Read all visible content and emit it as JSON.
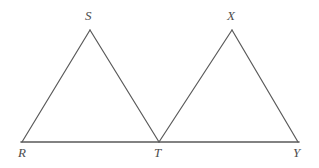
{
  "figure": {
    "type": "geometry-diagram",
    "background_color": "#ffffff",
    "stroke_color": "#5a5a5a",
    "label_color": "#4d4d4d",
    "stroke_width": 1.2,
    "baseline_stroke_width": 1.6,
    "canvas": {
      "width": 319,
      "height": 168
    },
    "points": {
      "R": {
        "label": "R",
        "x": 22,
        "y": 142,
        "label_x": 18,
        "label_y": 146
      },
      "S": {
        "label": "S",
        "x": 90,
        "y": 30,
        "label_x": 85,
        "label_y": 9
      },
      "T": {
        "label": "T",
        "x": 159,
        "y": 142,
        "label_x": 154,
        "label_y": 146
      },
      "X": {
        "label": "X",
        "x": 232,
        "y": 30,
        "label_x": 227,
        "label_y": 9
      },
      "Y": {
        "label": "Y",
        "x": 298,
        "y": 142,
        "label_x": 293,
        "label_y": 146
      }
    },
    "segments": [
      {
        "name": "segment-RS",
        "from": "R",
        "to": "S",
        "x1": 22,
        "y1": 142,
        "x2": 90,
        "y2": 30
      },
      {
        "name": "segment-ST",
        "from": "S",
        "to": "T",
        "x1": 90,
        "y1": 30,
        "x2": 159,
        "y2": 142
      },
      {
        "name": "segment-TX",
        "from": "T",
        "to": "X",
        "x1": 159,
        "y1": 142,
        "x2": 232,
        "y2": 30
      },
      {
        "name": "segment-XY",
        "from": "X",
        "to": "Y",
        "x1": 232,
        "y1": 30,
        "x2": 298,
        "y2": 142
      },
      {
        "name": "segment-RY-baseline",
        "from": "R",
        "to": "Y",
        "x1": 21,
        "y1": 142,
        "x2": 299,
        "y2": 142
      }
    ]
  }
}
